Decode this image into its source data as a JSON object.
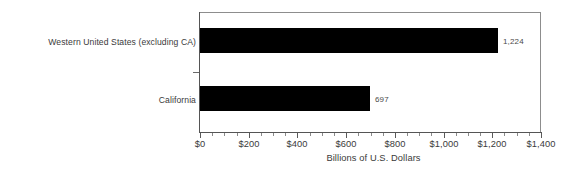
{
  "chart_data": {
    "type": "bar",
    "orientation": "horizontal",
    "title": "",
    "subtitle": "",
    "categories": [
      "Western United States (excluding CA)",
      "California"
    ],
    "values": [
      1224,
      697
    ],
    "value_labels": [
      "1,224",
      "697"
    ],
    "series": [
      {
        "name": "",
        "values": [
          1224,
          697
        ]
      }
    ],
    "xlabel": "Billions of U.S. Dollars",
    "ylabel": "",
    "xlim": [
      0,
      1400
    ],
    "xticks": [
      0,
      200,
      400,
      600,
      800,
      1000,
      1200,
      1400
    ],
    "xtick_labels": [
      "$0",
      "$200",
      "$400",
      "$600",
      "$800",
      "$1,000",
      "$1,200",
      "$1,400"
    ],
    "minor_ticks_between_majors": 3,
    "grid": false,
    "legend": false,
    "legend_position": "none",
    "bar_color": "#000000",
    "background_color": "#ffffff",
    "axis_color": "#555555",
    "text_color": "#3a3a3a"
  },
  "axis": {
    "x_title": "Billions of U.S. Dollars"
  },
  "bars": [
    {
      "label": "Western United States (excluding CA)",
      "value": 1224,
      "value_label": "1,224"
    },
    {
      "label": "California",
      "value": 697,
      "value_label": "697"
    }
  ],
  "ticks": [
    {
      "label": "$0"
    },
    {
      "label": "$200"
    },
    {
      "label": "$400"
    },
    {
      "label": "$600"
    },
    {
      "label": "$800"
    },
    {
      "label": "$1,000"
    },
    {
      "label": "$1,200"
    },
    {
      "label": "$1,400"
    }
  ]
}
